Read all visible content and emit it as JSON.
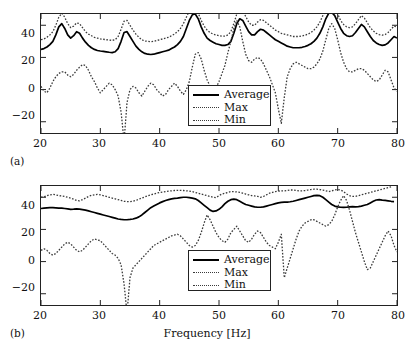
{
  "figure": {
    "panels": [
      {
        "id": "a",
        "label": "(a)"
      },
      {
        "id": "b",
        "label": "(b)"
      }
    ],
    "xlabel": "Frequency [Hz]"
  },
  "legend": {
    "entries": [
      {
        "label": "Average",
        "style": "solid"
      },
      {
        "label": "Max",
        "style": "dotted"
      },
      {
        "label": "Min",
        "style": "dotted"
      }
    ]
  },
  "axis": {
    "xticks": [
      "20",
      "30",
      "40",
      "50",
      "60",
      "70",
      "80"
    ],
    "yticks": [
      "40",
      "20",
      "0",
      "−20"
    ]
  },
  "colors": {
    "average": "#000000",
    "max": "#3a3a3a",
    "min": "#3a3a3a",
    "axis": "#222222",
    "background": "#ffffff"
  },
  "chart_data": [
    {
      "type": "line",
      "panel": "(a)",
      "title": "",
      "xlabel": "",
      "ylabel": "",
      "xlim": [
        20,
        80
      ],
      "ylim": [
        -27,
        47
      ],
      "xticks": [
        20,
        30,
        40,
        50,
        60,
        70,
        80
      ],
      "yticks": [
        -20,
        0,
        20,
        40
      ],
      "grid": false,
      "legend_position": "center",
      "x": [
        20,
        20.5,
        21,
        21.5,
        22,
        22.5,
        23,
        23.5,
        24,
        24.5,
        25,
        25.5,
        26,
        26.5,
        27,
        27.5,
        28,
        28.5,
        29,
        29.5,
        30,
        30.5,
        31,
        31.5,
        32,
        32.5,
        33,
        33.5,
        34,
        34.5,
        35,
        35.5,
        36,
        36.5,
        37,
        37.5,
        38,
        38.5,
        39,
        39.5,
        40,
        40.5,
        41,
        41.5,
        42,
        42.5,
        43,
        43.5,
        44,
        44.5,
        45,
        45.5,
        46,
        46.5,
        47,
        47.5,
        48,
        48.5,
        49,
        49.5,
        50,
        50.5,
        51,
        51.5,
        52,
        52.5,
        53,
        53.5,
        54,
        54.5,
        55,
        55.5,
        56,
        56.5,
        57,
        57.5,
        58,
        58.5,
        59,
        59.5,
        60,
        60.5,
        61,
        61.5,
        62,
        62.5,
        63,
        63.5,
        64,
        64.5,
        65,
        65.5,
        66,
        66.5,
        67,
        67.5,
        68,
        68.5,
        69,
        69.5,
        70,
        70.5,
        71,
        71.5,
        72,
        72.5,
        73,
        73.5,
        74,
        74.5,
        75,
        75.5,
        76,
        76.5,
        77,
        77.5,
        78,
        78.5,
        79,
        79.5,
        80
      ],
      "series": [
        {
          "name": "Average",
          "style": "solid",
          "values": [
            25,
            25.5,
            26.5,
            28,
            30,
            34,
            39,
            41,
            38,
            34,
            32,
            33.5,
            36,
            35,
            32,
            29.5,
            27.5,
            26,
            25,
            24.3,
            24,
            23.8,
            23.5,
            23.2,
            23,
            23.5,
            25.5,
            30,
            35.5,
            36,
            33,
            30,
            27,
            25,
            23.5,
            22.5,
            22,
            21.8,
            22,
            22.5,
            23,
            23.5,
            24,
            24.5,
            25.5,
            26.5,
            28,
            30,
            33,
            38,
            43,
            46.5,
            47,
            44,
            39,
            35,
            32,
            30.5,
            29.5,
            28.5,
            28,
            27.5,
            27.5,
            28,
            30,
            35,
            41,
            44,
            43,
            39.5,
            36,
            34,
            34,
            36,
            37.5,
            37,
            35.5,
            34,
            32.5,
            31,
            30,
            29,
            28,
            27,
            26.5,
            26,
            26,
            26,
            26.3,
            26.8,
            27.5,
            28.5,
            30,
            32,
            35,
            39,
            44,
            47.5,
            48,
            46,
            42,
            38,
            35,
            33.5,
            33,
            33.5,
            35.5,
            38,
            40.5,
            39,
            36,
            33,
            30.5,
            29,
            28,
            27.5,
            27.8,
            29,
            31,
            33,
            32,
            30,
            28.5
          ]
        },
        {
          "name": "Max",
          "style": "dotted",
          "values": [
            31,
            31.5,
            32.5,
            34,
            36,
            40,
            45,
            47.5,
            45,
            41,
            38.5,
            39.5,
            41.5,
            41,
            38.5,
            36,
            34.5,
            33.5,
            32.5,
            32,
            31.5,
            31.3,
            31,
            30.8,
            30.6,
            31,
            33,
            37.5,
            42.5,
            43,
            40,
            37,
            34.5,
            32.5,
            31,
            30.2,
            30,
            29.8,
            30,
            30.5,
            31,
            31.5,
            32,
            32.5,
            33.5,
            34.5,
            36,
            38,
            41,
            45,
            49,
            51,
            50.5,
            47.5,
            43,
            39.5,
            37,
            35.5,
            34.5,
            34,
            33.5,
            33.2,
            33.2,
            34,
            36,
            41,
            47,
            50,
            49,
            45.5,
            42,
            40,
            40,
            42,
            43.5,
            43,
            41.5,
            40,
            38.5,
            37,
            36,
            35,
            34.5,
            34,
            33.5,
            33,
            33,
            33,
            33.3,
            33.8,
            34.5,
            35.5,
            37,
            39,
            42,
            46,
            50,
            52.5,
            52.5,
            50.5,
            47,
            43,
            40.5,
            39,
            38.5,
            39,
            41,
            43.5,
            46,
            44.5,
            41.5,
            38.5,
            36.5,
            35,
            34.2,
            33.8,
            34.2,
            35.5,
            37.5,
            39.5,
            39,
            38,
            39
          ]
        },
        {
          "name": "Min",
          "style": "dotted",
          "values": [
            2,
            -1,
            -2,
            1,
            5,
            8,
            10,
            11,
            11,
            9,
            8,
            9.5,
            12,
            14,
            15.5,
            15,
            12,
            8,
            5,
            1,
            -2,
            0,
            2,
            4,
            3,
            0,
            -4,
            -14,
            -32,
            -8,
            0,
            2,
            1,
            -2,
            -4,
            -1,
            2,
            4,
            3,
            0,
            -2,
            -4,
            -3,
            0,
            2,
            4,
            2,
            -1,
            -3,
            0,
            5,
            14,
            22,
            23,
            19,
            12,
            6,
            2,
            0,
            1,
            5,
            10,
            15,
            23,
            30,
            38,
            43,
            39,
            30,
            22,
            18,
            17,
            19,
            20,
            19,
            16,
            12,
            8,
            3,
            -2,
            -12,
            -21,
            -5,
            8,
            13,
            16,
            17,
            16,
            15,
            14,
            13,
            13,
            14,
            16,
            19,
            24,
            31,
            38,
            41,
            38,
            31,
            23,
            17,
            13,
            11,
            11,
            12,
            13,
            13,
            12,
            10,
            8,
            6,
            5,
            6,
            9,
            12,
            11,
            6,
            1,
            -1
          ]
        }
      ]
    },
    {
      "type": "line",
      "panel": "(b)",
      "title": "",
      "xlabel": "Frequency [Hz]",
      "ylabel": "",
      "xlim": [
        20,
        80
      ],
      "ylim": [
        -27,
        47
      ],
      "xticks": [
        20,
        30,
        40,
        50,
        60,
        70,
        80
      ],
      "yticks": [
        -20,
        0,
        20,
        40
      ],
      "grid": false,
      "legend_position": "center",
      "x": [
        20,
        20.5,
        21,
        21.5,
        22,
        22.5,
        23,
        23.5,
        24,
        24.5,
        25,
        25.5,
        26,
        26.5,
        27,
        27.5,
        28,
        28.5,
        29,
        29.5,
        30,
        30.5,
        31,
        31.5,
        32,
        32.5,
        33,
        33.5,
        34,
        34.5,
        35,
        35.5,
        36,
        36.5,
        37,
        37.5,
        38,
        38.5,
        39,
        39.5,
        40,
        40.5,
        41,
        41.5,
        42,
        42.5,
        43,
        43.5,
        44,
        44.5,
        45,
        45.5,
        46,
        46.5,
        47,
        47.5,
        48,
        48.5,
        49,
        49.5,
        50,
        50.5,
        51,
        51.5,
        52,
        52.5,
        53,
        53.5,
        54,
        54.5,
        55,
        55.5,
        56,
        56.5,
        57,
        57.5,
        58,
        58.5,
        59,
        59.5,
        60,
        60.5,
        61,
        61.5,
        62,
        62.5,
        63,
        63.5,
        64,
        64.5,
        65,
        65.5,
        66,
        66.5,
        67,
        67.5,
        68,
        68.5,
        69,
        69.5,
        70,
        70.5,
        71,
        71.5,
        72,
        72.5,
        73,
        73.5,
        74,
        74.5,
        75,
        75.5,
        76,
        76.5,
        77,
        77.5,
        78,
        78.5,
        79,
        79.5,
        80
      ],
      "series": [
        {
          "name": "Average",
          "style": "solid",
          "values": [
            33,
            33.2,
            33.4,
            33.5,
            33.5,
            33.4,
            33.3,
            33.2,
            33,
            32.8,
            32.5,
            32.6,
            32.8,
            32.6,
            32.3,
            32,
            31.5,
            31,
            30.5,
            30,
            29.5,
            29,
            28.5,
            28,
            27.5,
            27,
            26.5,
            26.2,
            26,
            26,
            26.2,
            26.5,
            27,
            27.8,
            29,
            30.5,
            32,
            33.5,
            34.5,
            35.5,
            36.5,
            37.3,
            38,
            38.5,
            39,
            39.3,
            39.5,
            39.8,
            40,
            40,
            39.8,
            39.5,
            39,
            38,
            36.5,
            35,
            33.5,
            32,
            31.2,
            31.5,
            32.5,
            34,
            36,
            37.5,
            38.5,
            38.8,
            38.5,
            37.5,
            36.5,
            35.5,
            35,
            34.5,
            34,
            33.8,
            33.8,
            34,
            34.5,
            35,
            35.5,
            36,
            36.5,
            36.8,
            37,
            37,
            37.2,
            37.5,
            38,
            38.5,
            39,
            39.5,
            40,
            40.5,
            41,
            41.2,
            41,
            40,
            38.5,
            37,
            35.5,
            34.5,
            34,
            33.8,
            33.7,
            33.8,
            34,
            34.2,
            34,
            34.2,
            34.5,
            35,
            35.5,
            36.5,
            37.5,
            38.3,
            38.5,
            38.2,
            38,
            37.8,
            37.5,
            37.3
          ]
        },
        {
          "name": "Max",
          "style": "dotted",
          "values": [
            40,
            40.2,
            41,
            41.5,
            41.8,
            41.5,
            41,
            40.8,
            40.5,
            40,
            39.5,
            38.8,
            38,
            37.8,
            38.5,
            39.5,
            40.5,
            41.2,
            41.5,
            41.8,
            41.5,
            41,
            40.5,
            40,
            39.5,
            39,
            38.5,
            38,
            37.5,
            37.3,
            37.2,
            37.5,
            38,
            38.8,
            39.5,
            40.2,
            41,
            41.5,
            42,
            42.5,
            43,
            43.2,
            43.5,
            43.8,
            44,
            44.2,
            44.3,
            44.3,
            44.2,
            44,
            43.8,
            43.5,
            43,
            42.5,
            42,
            41.5,
            41,
            40.5,
            40,
            39.8,
            41,
            42,
            42.5,
            43,
            43.5,
            43.5,
            43.3,
            43,
            42.5,
            42,
            41.5,
            41,
            40.8,
            40.5,
            40,
            40.5,
            41.5,
            42.5,
            43,
            43.5,
            43.8,
            44,
            44,
            44.2,
            44.5,
            44.5,
            44.3,
            44,
            44,
            44.2,
            44.5,
            44.8,
            45,
            45,
            44.8,
            44.5,
            44,
            43.5,
            44,
            44.5,
            44.8,
            44.5,
            43.5,
            42,
            41,
            40.5,
            40.5,
            41,
            41.5,
            42,
            42.5,
            43,
            43.5,
            44,
            44.5,
            45,
            45.5,
            46,
            46.5
          ]
        },
        {
          "name": "Min",
          "style": "dotted",
          "values": [
            7,
            8,
            7,
            5,
            4,
            5,
            7,
            9,
            11,
            12,
            11,
            9,
            7,
            6,
            7,
            9,
            11,
            13,
            14,
            13.5,
            13,
            11,
            9,
            7,
            5,
            4,
            2,
            -2,
            -14,
            -32,
            -10,
            -4,
            -2,
            0,
            2,
            4,
            6,
            8,
            10,
            11,
            12,
            13,
            14,
            15,
            16,
            16.5,
            17,
            16,
            14,
            12,
            10,
            9,
            10,
            13,
            18,
            24,
            29,
            26,
            22,
            18,
            15,
            13,
            12,
            14,
            18,
            20,
            22,
            19,
            16,
            13,
            12,
            14,
            17,
            19,
            18,
            15,
            12,
            10,
            9,
            8,
            12,
            17,
            -10,
            -4,
            2,
            8,
            14,
            19,
            22,
            24,
            25,
            26,
            26,
            25,
            24,
            23,
            22,
            23,
            25,
            29,
            34,
            38,
            41,
            38,
            32,
            25,
            18,
            12,
            6,
            0,
            -5,
            -4,
            0,
            4,
            8,
            12,
            16,
            19,
            16,
            10,
            6,
            8,
            12,
            15
          ]
        }
      ]
    }
  ]
}
